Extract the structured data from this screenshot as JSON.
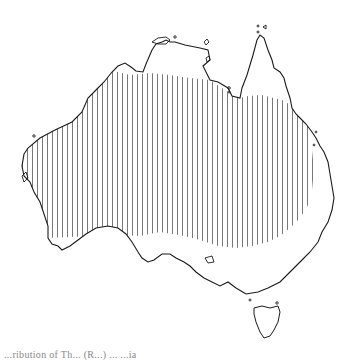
{
  "figure": {
    "shaded_region": "Distribution area (vertical hatching) covering northern, central and western Australia, excluding the south-east coastal strip and Cape York",
    "hatch_style": "vertical lines",
    "colors": {
      "outline": "#1a1a1a",
      "hatch": "#555555",
      "background": "#ffffff"
    },
    "caption_partial": "...ribution of Th... (R...) ... ...ia"
  }
}
